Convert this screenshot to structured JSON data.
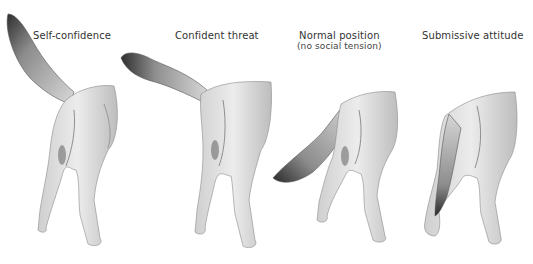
{
  "figure": {
    "panels": [
      {
        "id": "self-confidence",
        "label": "Self-confidence",
        "sublabel": "",
        "tail_position": "raised high, upright"
      },
      {
        "id": "confident-threat",
        "label": "Confident threat",
        "sublabel": "",
        "tail_position": "raised, extended horizontally"
      },
      {
        "id": "normal-position",
        "label": "Normal position",
        "sublabel": "(no social tension)",
        "tail_position": "hanging down and out"
      },
      {
        "id": "submissive-attitude",
        "label": "Submissive attitude",
        "sublabel": "",
        "tail_position": "tucked between legs"
      }
    ],
    "colors": {
      "fur_light": "#e6e6e6",
      "fur_mid": "#b5b5b5",
      "fur_dark": "#3a3a3a",
      "background": "#ffffff"
    }
  }
}
